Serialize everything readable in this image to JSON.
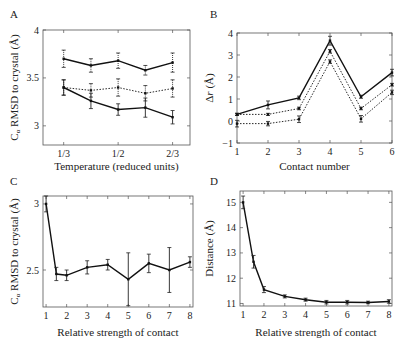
{
  "chart_data": [
    {
      "panel": "A",
      "type": "line",
      "title": "",
      "xlabel": "Temperature (reduced units)",
      "ylabel": "C_α RMSD to crystal (Å)",
      "x": [
        0.3333,
        0.4167,
        0.5,
        0.5833,
        0.6667
      ],
      "xticks": [
        0.3333,
        0.5,
        0.6667
      ],
      "xticklabels": [
        "1/3",
        "1/2",
        "2/3"
      ],
      "yticks": [
        3,
        3.5,
        4
      ],
      "yticklabels": [
        "3",
        "3.5",
        "4"
      ],
      "xlim": [
        0.27,
        0.72
      ],
      "ylim": [
        2.8,
        4.0
      ],
      "grid": false,
      "series": [
        {
          "name": "upper",
          "style": "solid",
          "errstyle": "dotted",
          "values": [
            3.7,
            3.63,
            3.68,
            3.58,
            3.66
          ],
          "err": [
            0.09,
            0.07,
            0.08,
            0.05,
            0.1
          ]
        },
        {
          "name": "middle",
          "style": "dotted",
          "errstyle": "dotted",
          "values": [
            3.4,
            3.37,
            3.4,
            3.34,
            3.39
          ],
          "err": [
            0.08,
            0.07,
            0.09,
            0.08,
            0.09
          ]
        },
        {
          "name": "lower",
          "style": "solid",
          "errstyle": "solid",
          "values": [
            3.4,
            3.26,
            3.17,
            3.19,
            3.09
          ],
          "err": [
            0.08,
            0.08,
            0.06,
            0.1,
            0.07
          ]
        }
      ]
    },
    {
      "panel": "B",
      "type": "line",
      "title": "",
      "xlabel": "Contact number",
      "ylabel": "Δr (Å)",
      "x": [
        1,
        2,
        3,
        4,
        5,
        6
      ],
      "xticks": [
        1,
        2,
        3,
        4,
        5,
        6
      ],
      "xticklabels": [
        "1",
        "2",
        "3",
        "4",
        "5",
        "6"
      ],
      "yticks": [
        -1,
        0,
        1,
        2,
        3,
        4
      ],
      "yticklabels": [
        "−1",
        "0",
        "1",
        "2",
        "3",
        "4"
      ],
      "xlim": [
        1,
        6
      ],
      "ylim": [
        -1,
        4
      ],
      "grid": false,
      "series": [
        {
          "name": "series-1",
          "style": "solid",
          "errstyle": "solid",
          "values": [
            0.3,
            0.73,
            1.05,
            3.65,
            1.1,
            2.2
          ],
          "err": [
            0.05,
            0.18,
            0.08,
            0.2,
            0.07,
            0.15
          ]
        },
        {
          "name": "series-2",
          "style": "dotted",
          "errstyle": "solid",
          "values": [
            0.3,
            0.3,
            0.57,
            3.17,
            0.57,
            1.65
          ],
          "err": [
            0.05,
            0.05,
            0.06,
            0.08,
            0.06,
            0.06
          ]
        },
        {
          "name": "series-3",
          "style": "dotted",
          "errstyle": "solid",
          "values": [
            -0.12,
            -0.12,
            0.08,
            2.7,
            0.1,
            1.3
          ],
          "err": [
            0.15,
            0.1,
            0.15,
            0.08,
            0.15,
            0.1
          ]
        }
      ]
    },
    {
      "panel": "C",
      "type": "line",
      "title": "",
      "xlabel": "Relative strength of contact",
      "ylabel": "C_α RMSD to crystal (Å)",
      "x": [
        1,
        1.5,
        2,
        3,
        4,
        5,
        6,
        7,
        8
      ],
      "xticks": [
        1,
        2,
        3,
        4,
        5,
        6,
        7,
        8
      ],
      "xticklabels": [
        "1",
        "2",
        "3",
        "4",
        "5",
        "6",
        "7",
        "8"
      ],
      "yticks": [
        2.5,
        3
      ],
      "yticklabels": [
        "2.5",
        "3"
      ],
      "xlim": [
        0.85,
        8.15
      ],
      "ylim": [
        2.22,
        3.06
      ],
      "grid": false,
      "series": [
        {
          "name": "rmsd",
          "style": "solid",
          "errstyle": "solid",
          "values": [
            3.0,
            2.47,
            2.46,
            2.52,
            2.54,
            2.43,
            2.55,
            2.5,
            2.56
          ],
          "err": [
            0.06,
            0.05,
            0.04,
            0.05,
            0.04,
            0.2,
            0.07,
            0.17,
            0.04
          ]
        }
      ]
    },
    {
      "panel": "D",
      "type": "line",
      "title": "",
      "xlabel": "Relative strength of contact",
      "ylabel": "Distance (Å)",
      "x": [
        1,
        1.5,
        2,
        3,
        4,
        5,
        6,
        7,
        8
      ],
      "xticks": [
        1,
        2,
        3,
        4,
        5,
        6,
        7,
        8
      ],
      "xticklabels": [
        "1",
        "2",
        "3",
        "4",
        "5",
        "6",
        "7",
        "8"
      ],
      "yticks": [
        11,
        12,
        13,
        14,
        15
      ],
      "yticklabels": [
        "11",
        "12",
        "13",
        "14",
        "15"
      ],
      "xlim": [
        0.85,
        8.15
      ],
      "ylim": [
        10.9,
        15.45
      ],
      "grid": false,
      "series": [
        {
          "name": "distance",
          "style": "solid",
          "errstyle": "solid",
          "values": [
            15.0,
            12.65,
            11.55,
            11.28,
            11.15,
            11.05,
            11.05,
            11.04,
            11.08
          ],
          "err": [
            0.25,
            0.25,
            0.12,
            0.06,
            0.06,
            0.07,
            0.07,
            0.05,
            0.07
          ]
        }
      ]
    }
  ],
  "panels": [
    {
      "letter": "A",
      "box": [
        43,
        30,
        190,
        145
      ],
      "letter_pos": [
        10,
        18
      ],
      "ylabel_x": 18,
      "xlabel_y": 170
    },
    {
      "letter": "B",
      "box": [
        237,
        33,
        392,
        143
      ],
      "letter_pos": [
        210,
        18
      ],
      "ylabel_x": 213,
      "xlabel_y": 170
    },
    {
      "letter": "C",
      "box": [
        43,
        196,
        193,
        307
      ],
      "letter_pos": [
        10,
        185
      ],
      "ylabel_x": 18,
      "xlabel_y": 336
    },
    {
      "letter": "D",
      "box": [
        240,
        191,
        392,
        306
      ],
      "letter_pos": [
        210,
        185
      ],
      "ylabel_x": 213,
      "xlabel_y": 336
    }
  ]
}
